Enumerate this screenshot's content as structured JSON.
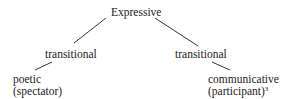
{
  "diagram": {
    "root": {
      "label": "Expressive"
    },
    "branches": [
      {
        "label": "transitional",
        "leaf": {
          "line1": "poetic",
          "line2": "(spectator)"
        }
      },
      {
        "label": "transitional",
        "leaf": {
          "line1": "communicative",
          "line2": "(participant)",
          "footnote": "3"
        }
      }
    ]
  }
}
